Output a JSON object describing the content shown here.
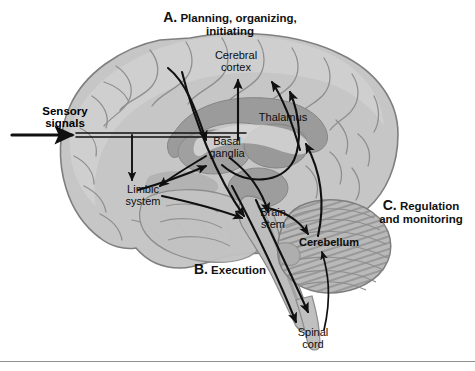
{
  "figure": {
    "type": "anatomical-diagram",
    "background_color": "#ffffff",
    "divider_color": "#8e8e8e"
  },
  "sections": {
    "a": {
      "letter": "A.",
      "text": "Planning, organizing,\ninitiating"
    },
    "b": {
      "letter": "B.",
      "text": "Execution"
    },
    "c": {
      "letter": "C.",
      "text": "Regulation\nand monitoring"
    }
  },
  "input": {
    "sensory_label": "Sensory\nsignals"
  },
  "structures": [
    {
      "id": "cerebral-cortex",
      "label": "Cerebral\ncortex",
      "bold": false
    },
    {
      "id": "thalamus",
      "label": "Thalamus",
      "bold": false
    },
    {
      "id": "basal-ganglia",
      "label": "Basal\nganglia",
      "bold": false
    },
    {
      "id": "limbic-system",
      "label": "Limbic\nsystem",
      "bold": false
    },
    {
      "id": "brain-stem",
      "label": "Brain\nstem",
      "bold": false
    },
    {
      "id": "cerebellum",
      "label": "Cerebellum",
      "bold": true
    },
    {
      "id": "spinal-cord",
      "label": "Spinal\ncord",
      "bold": false
    }
  ],
  "colors": {
    "cortex_fill": "#c3c3c3",
    "cortex_fill_light": "#cfcfcf",
    "cortex_stroke": "#8a8a8a",
    "deep_gray": "#9a9a9a",
    "deep_gray_dark": "#8c8c8c",
    "cerebellum_fill": "#b5b5b5",
    "cerebellum_stripe": "#949494",
    "brainstem_fill": "#bdbdbd",
    "arrow_color": "#101010",
    "text_color": "#111111"
  }
}
